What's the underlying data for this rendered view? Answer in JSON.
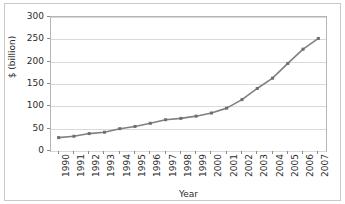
{
  "chart_data": {
    "type": "line",
    "title": "",
    "xlabel": "Year",
    "ylabel": "$ (billion)",
    "categories": [
      "1990",
      "1991",
      "1992",
      "1993",
      "1994",
      "1995",
      "1996",
      "1997",
      "1998",
      "1999",
      "2000",
      "2001",
      "2002",
      "2003",
      "2004",
      "2005",
      "2006",
      "2007"
    ],
    "values": [
      30,
      33,
      39,
      42,
      50,
      55,
      62,
      70,
      73,
      78,
      85,
      96,
      115,
      140,
      163,
      196,
      228,
      252
    ],
    "series": [
      {
        "name": "",
        "values": [
          30,
          33,
          39,
          42,
          50,
          55,
          62,
          70,
          73,
          78,
          85,
          96,
          115,
          140,
          163,
          196,
          228,
          252
        ]
      }
    ],
    "ylim": [
      0,
      300
    ],
    "y_ticks": [
      0,
      50,
      100,
      150,
      200,
      250,
      300
    ],
    "y_tick_labels": [
      "0",
      "50",
      "100",
      "150",
      "200",
      "250",
      "300"
    ],
    "x_tick_labels": [
      "1990",
      "1991",
      "1992",
      "1993",
      "1994",
      "1995",
      "1996",
      "1997",
      "1998",
      "1999",
      "2000",
      "2001",
      "2002",
      "2003",
      "2004",
      "2005",
      "2006",
      "2007"
    ],
    "grid": true,
    "grid_axis": "y",
    "legend": false,
    "legend_position": "none",
    "marker": "square",
    "line_color": "#808080",
    "marker_color": "#6e6e6e",
    "grid_color": "#d9d9d9",
    "axis_color": "#b5b5b5",
    "text_color": "#2b2b2b",
    "background_color": "#ffffff"
  }
}
